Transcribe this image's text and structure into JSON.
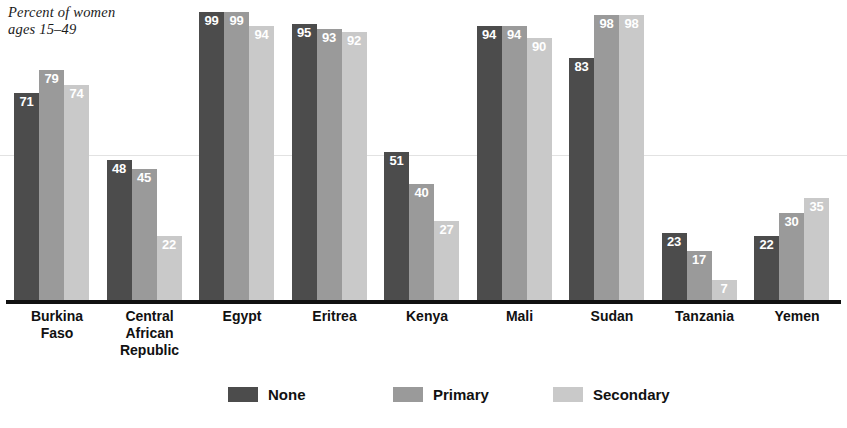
{
  "chart_data": {
    "type": "bar",
    "title": "Percent of women\nages 15–49",
    "xlabel": "",
    "ylabel": "Percent of women ages 15-49",
    "ylim": [
      0,
      100
    ],
    "grid": true,
    "gridlines": [
      50
    ],
    "legend_position": "bottom",
    "categories": [
      "Burkina\nFaso",
      "Central\nAfrican\nRepublic",
      "Egypt",
      "Eritrea",
      "Kenya",
      "Mali",
      "Sudan",
      "Tanzania",
      "Yemen"
    ],
    "series": [
      {
        "name": "None",
        "color": "#4c4c4c",
        "values": [
          71,
          48,
          99,
          95,
          51,
          94,
          83,
          23,
          22
        ]
      },
      {
        "name": "Primary",
        "color": "#9a9a9a",
        "values": [
          79,
          45,
          99,
          93,
          40,
          94,
          98,
          17,
          30
        ]
      },
      {
        "name": "Secondary",
        "color": "#c9c9c9",
        "values": [
          74,
          22,
          94,
          92,
          27,
          90,
          98,
          7,
          35
        ]
      }
    ]
  },
  "legend": {
    "items": [
      {
        "label": "None",
        "swatch": "none"
      },
      {
        "label": "Primary",
        "swatch": "primary"
      },
      {
        "label": "Secondary",
        "swatch": "secondary"
      }
    ]
  }
}
